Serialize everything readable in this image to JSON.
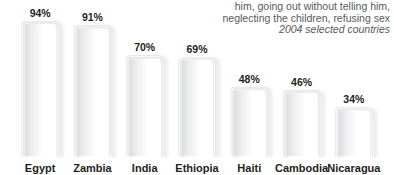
{
  "caption": {
    "lines": [
      {
        "text": "him, going out without telling him,",
        "italic": false
      },
      {
        "text": "neglecting the children, refusing sex",
        "italic": false
      },
      {
        "text": "2004 selected countries",
        "italic": true
      }
    ]
  },
  "colors": {
    "background": "#ffffff",
    "bar_stroke": "#d7d8da",
    "bar_fill": "#ffffff",
    "bar_inner_shade": "#e8e9ea",
    "shadow": "#c9cacc",
    "label_text": "#231f20",
    "caption_text": "#58595b"
  },
  "chart_data": {
    "type": "bar",
    "title": "him, going out without telling him, neglecting the children, refusing sex",
    "subtitle": "2004 selected countries",
    "xlabel": "",
    "ylabel": "",
    "ylim": [
      0,
      100
    ],
    "grid": false,
    "legend": "none",
    "value_suffix": "%",
    "categories": [
      "Egypt",
      "Zambia",
      "India",
      "Ethiopia",
      "Haiti",
      "Cambodia",
      "Nicaragua"
    ],
    "values": [
      94,
      91,
      70,
      69,
      48,
      46,
      34
    ],
    "value_labels": [
      "94%",
      "91%",
      "70%",
      "69%",
      "48%",
      "46%",
      "34%"
    ]
  }
}
